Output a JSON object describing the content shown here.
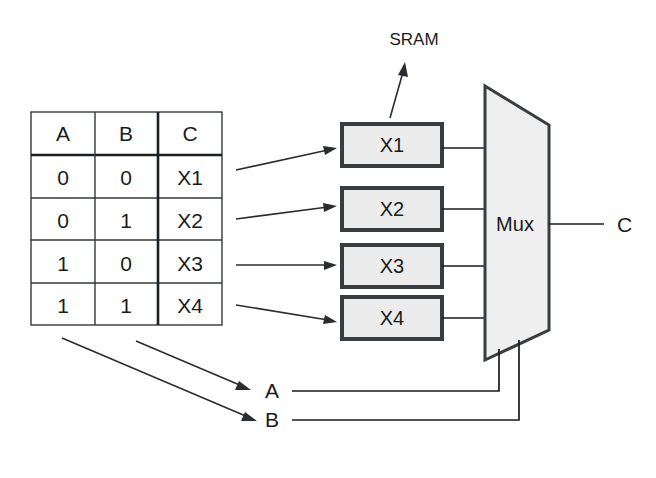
{
  "diagram": {
    "title_label": "SRAM",
    "truth_table": {
      "name": "truth-table",
      "headers": [
        "A",
        "B",
        "C"
      ],
      "rows": [
        [
          "0",
          "0",
          "X1"
        ],
        [
          "0",
          "1",
          "X2"
        ],
        [
          "1",
          "0",
          "X3"
        ],
        [
          "1",
          "1",
          "X4"
        ]
      ]
    },
    "memory_cells": [
      {
        "label": "X1"
      },
      {
        "label": "X2"
      },
      {
        "label": "X3"
      },
      {
        "label": "X4"
      }
    ],
    "mux": {
      "label": "Mux"
    },
    "output": {
      "label": "C"
    },
    "select_inputs": [
      {
        "label": "A"
      },
      {
        "label": "B"
      }
    ],
    "colors": {
      "line": "#1b1b1b",
      "box_fill": "#ececed",
      "box_stroke": "#3a3d40",
      "mux_fill": "#eeeeee",
      "background": "#ffffff"
    }
  }
}
